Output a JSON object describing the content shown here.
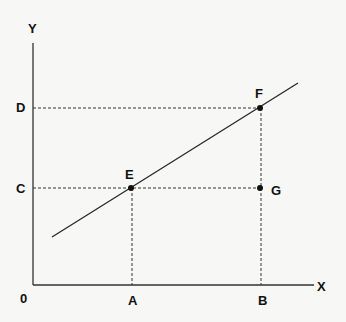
{
  "diagram": {
    "axes": {
      "x_label": "X",
      "y_label": "Y",
      "origin_label": "0"
    },
    "x_ticks": [
      {
        "label": "A"
      },
      {
        "label": "B"
      }
    ],
    "y_ticks": [
      {
        "label": "C"
      },
      {
        "label": "D"
      }
    ],
    "points": [
      {
        "label": "E"
      },
      {
        "label": "F"
      },
      {
        "label": "G"
      }
    ],
    "colors": {
      "background": "#f7f7f5",
      "ink": "#111111"
    }
  }
}
